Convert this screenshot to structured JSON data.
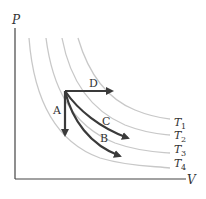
{
  "diagram": {
    "axes": {
      "y_label": "P",
      "x_label": "V"
    },
    "isotherms": [
      {
        "label": "T",
        "sub": "1"
      },
      {
        "label": "T",
        "sub": "2"
      },
      {
        "label": "T",
        "sub": "3"
      },
      {
        "label": "T",
        "sub": "4"
      }
    ],
    "processes": [
      {
        "label": "A"
      },
      {
        "label": "B"
      },
      {
        "label": "C"
      },
      {
        "label": "D"
      }
    ],
    "colors": {
      "isotherm": "#c8c8c8",
      "arrow": "#3a3a3a",
      "axis": "#444444"
    }
  }
}
